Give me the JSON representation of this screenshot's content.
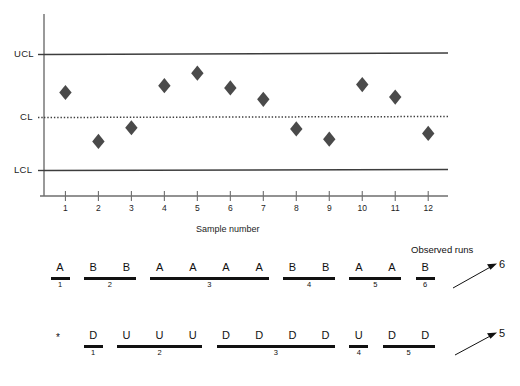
{
  "chart_data": {
    "type": "scatter",
    "title": "",
    "xlabel": "Sample number",
    "ylabel": "",
    "grid": false,
    "legend": null,
    "x": [
      1,
      2,
      3,
      4,
      5,
      6,
      7,
      8,
      9,
      10,
      11,
      12
    ],
    "categories": [
      "1",
      "2",
      "3",
      "4",
      "5",
      "6",
      "7",
      "8",
      "9",
      "10",
      "11",
      "12"
    ],
    "series": [
      {
        "name": "Sample value",
        "marker": "diamond",
        "color": "#4a4a4a",
        "values": [
          0.66,
          0.23,
          0.35,
          0.72,
          0.83,
          0.7,
          0.6,
          0.34,
          0.25,
          0.73,
          0.62,
          0.3
        ]
      }
    ],
    "control_limits": {
      "ucl": {
        "label": "UCL",
        "value": 1.0
      },
      "cl": {
        "label": "CL",
        "value": 0.5
      },
      "lcl": {
        "label": "LCL",
        "value": 0.0
      }
    },
    "ylim": [
      -0.25,
      1.35
    ],
    "xlim": [
      0.35,
      12.6
    ],
    "axis_tick_labels": [
      "1",
      "2",
      "3",
      "4",
      "5",
      "6",
      "7",
      "8",
      "9",
      "10",
      "11",
      "12"
    ]
  },
  "chart": {
    "ucl_label": "UCL",
    "cl_label": "CL",
    "lcl_label": "LCL",
    "x_axis_title": "Sample number"
  },
  "runs_analysis": {
    "observed_runs_heading": "Observed runs",
    "above_below_row": {
      "name": "runs-about-median",
      "letters": [
        "A",
        "B",
        "B",
        "A",
        "A",
        "A",
        "A",
        "B",
        "B",
        "A",
        "A",
        "B"
      ],
      "groups": [
        {
          "index": "1",
          "letters": [
            "A"
          ],
          "start": 1,
          "end": 1
        },
        {
          "index": "2",
          "letters": [
            "B",
            "B"
          ],
          "start": 2,
          "end": 3
        },
        {
          "index": "3",
          "letters": [
            "A",
            "A",
            "A",
            "A"
          ],
          "start": 4,
          "end": 7
        },
        {
          "index": "4",
          "letters": [
            "B",
            "B"
          ],
          "start": 8,
          "end": 9
        },
        {
          "index": "5",
          "letters": [
            "A",
            "A"
          ],
          "start": 10,
          "end": 11
        },
        {
          "index": "6",
          "letters": [
            "B"
          ],
          "start": 12,
          "end": 12
        }
      ],
      "observed_runs": "6"
    },
    "up_down_row": {
      "name": "runs-up-and-down",
      "leading_symbol": "*",
      "letters": [
        "D",
        "U",
        "U",
        "U",
        "D",
        "D",
        "D",
        "D",
        "U",
        "D",
        "D"
      ],
      "groups": [
        {
          "index": "1",
          "letters": [
            "D"
          ],
          "start": 2,
          "end": 2
        },
        {
          "index": "2",
          "letters": [
            "U",
            "U",
            "U"
          ],
          "start": 3,
          "end": 5
        },
        {
          "index": "3",
          "letters": [
            "D",
            "D",
            "D",
            "D"
          ],
          "start": 6,
          "end": 9
        },
        {
          "index": "4",
          "letters": [
            "U"
          ],
          "start": 10,
          "end": 10
        },
        {
          "index": "5",
          "letters": [
            "D",
            "D"
          ],
          "start": 11,
          "end": 12
        }
      ],
      "observed_runs": "5"
    }
  },
  "colors": {
    "marker": "#4a4a4a",
    "limit_line": "#3d3d3d",
    "axis": "#6e6e6e",
    "text": "#1a1a1a",
    "run_bar": "#111111"
  }
}
